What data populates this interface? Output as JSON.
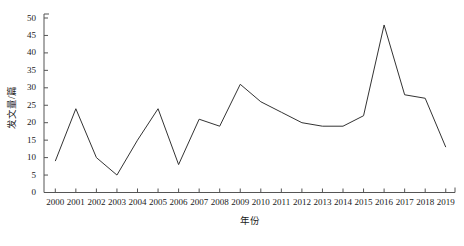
{
  "chart_data": {
    "type": "line",
    "title": "",
    "subtitle": "",
    "xlabel": "年份",
    "ylabel": "发文量/篇",
    "categories": [
      "2000",
      "2001",
      "2002",
      "2003",
      "2004",
      "2005",
      "2006",
      "2007",
      "2008",
      "2009",
      "2010",
      "2011",
      "2012",
      "2013",
      "2014",
      "2015",
      "2016",
      "2017",
      "2018",
      "2019"
    ],
    "values": [
      9,
      24,
      10,
      5,
      15,
      24,
      8,
      21,
      19,
      31,
      26,
      23,
      20,
      19,
      19,
      22,
      48,
      28,
      27,
      13
    ],
    "series": [
      {
        "name": "发文量",
        "values": [
          9,
          24,
          10,
          5,
          15,
          24,
          8,
          21,
          19,
          31,
          26,
          23,
          20,
          19,
          19,
          22,
          48,
          28,
          27,
          13
        ]
      }
    ],
    "xtick_labels": [
      "2000",
      "2001",
      "2002",
      "2003",
      "2004",
      "2005",
      "2006",
      "2007",
      "2008",
      "2009",
      "2010",
      "2011",
      "2012",
      "2013",
      "2014",
      "2015",
      "2016",
      "2017",
      "2018",
      "2019"
    ],
    "ytick_labels": [
      "0",
      "5",
      "10",
      "15",
      "20",
      "25",
      "30",
      "35",
      "40",
      "45",
      "50"
    ],
    "ytick_values": [
      0,
      5,
      10,
      15,
      20,
      25,
      30,
      35,
      40,
      45,
      50
    ],
    "ylim": [
      0,
      50
    ],
    "grid": false,
    "legend": false,
    "legend_position": "none",
    "markers": false,
    "line_color": "#333333",
    "axis_color": "#555555",
    "background_color": "#ffffff",
    "annotations": []
  }
}
